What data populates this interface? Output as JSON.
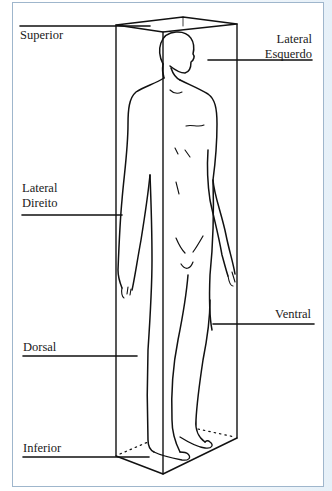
{
  "diagram": {
    "type": "anatomical-planes",
    "labels": {
      "superior": "Superior",
      "lateral_esquerdo_line1": "Lateral",
      "lateral_esquerdo_line2": "Esquerdo",
      "lateral_direito_line1": "Lateral",
      "lateral_direito_line2": "Direito",
      "ventral": "Ventral",
      "dorsal": "Dorsal",
      "inferior": "Inferior"
    }
  },
  "colors": {
    "line": "#111111",
    "frame_border": "#9fb6cc",
    "background": "#ffffff"
  }
}
